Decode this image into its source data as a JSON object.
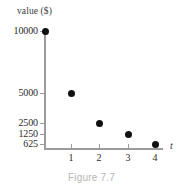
{
  "chart_data": {
    "type": "scatter",
    "title": "",
    "xlabel": "t",
    "ylabel": "value ($)",
    "x": [
      0,
      1,
      2,
      3,
      4
    ],
    "values": [
      10000,
      5000,
      2500,
      1250,
      625
    ],
    "points": [
      {
        "x": 0,
        "y": 10000,
        "px": 45,
        "py": 31
      },
      {
        "x": 1,
        "y": 5000,
        "px": 71,
        "py": 93
      },
      {
        "x": 2,
        "y": 2500,
        "px": 99,
        "py": 123
      },
      {
        "x": 3,
        "y": 1250,
        "px": 128,
        "py": 134
      },
      {
        "x": 4,
        "y": 625,
        "px": 155,
        "py": 144
      }
    ],
    "ytick_labels": [
      "10000",
      "5000",
      "2500",
      "1250",
      "625"
    ],
    "ytick_positions": [
      31,
      93,
      123,
      134,
      144
    ],
    "xtick_labels": [
      "1",
      "2",
      "3",
      "4"
    ],
    "xtick_positions": [
      71,
      99,
      128,
      155
    ],
    "grid": false,
    "legend": "none",
    "marker_color": "#111111",
    "axis_color": "#9b9b9b"
  },
  "figure": {
    "caption": "Figure 7.7",
    "caption_color": "#b6b6b6"
  }
}
